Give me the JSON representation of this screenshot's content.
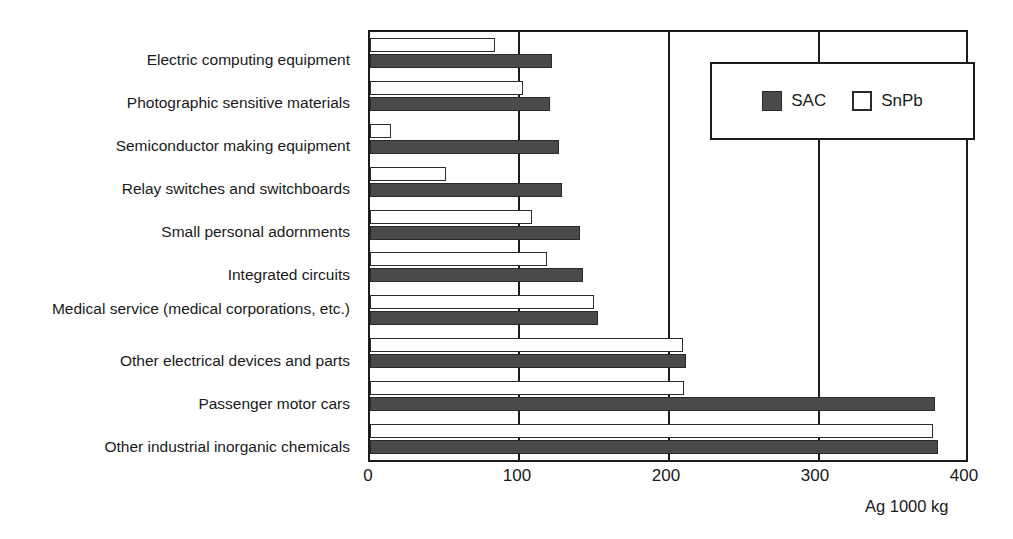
{
  "chart_data": {
    "type": "bar",
    "orientation": "horizontal",
    "title": "",
    "xlabel": "Ag 1000 kg",
    "ylabel": "",
    "xlim": [
      0,
      400
    ],
    "xticks": [
      0,
      100,
      200,
      300,
      400
    ],
    "xtick_labels": [
      "0",
      "100",
      "200",
      "300",
      "400"
    ],
    "grid": true,
    "legend_position": "upper right",
    "categories": [
      "Electric computing equipment",
      "Photographic sensitive materials",
      "Semiconductor making equipment",
      "Relay switches and switchboards",
      "Small personal adornments",
      "Integrated circuits",
      "Medical service (medical corporations, etc.)",
      "Other electrical devices and parts",
      "Passenger motor cars",
      "Other industrial inorganic chemicals"
    ],
    "series": [
      {
        "name": "SnPb",
        "color": "#ffffff",
        "values": [
          84,
          103,
          14,
          51,
          109,
          119,
          150,
          210,
          211,
          378
        ]
      },
      {
        "name": "SAC",
        "color": "#4a4a4a",
        "values": [
          122,
          121,
          127,
          129,
          141,
          143,
          153,
          212,
          379,
          381
        ]
      }
    ]
  },
  "legend": {
    "items": [
      {
        "label": "SAC",
        "swatch": "filled-dark-square"
      },
      {
        "label": "SnPb",
        "swatch": "empty-white-square"
      }
    ]
  },
  "axis": {
    "x_title": "Ag 1000 kg"
  }
}
